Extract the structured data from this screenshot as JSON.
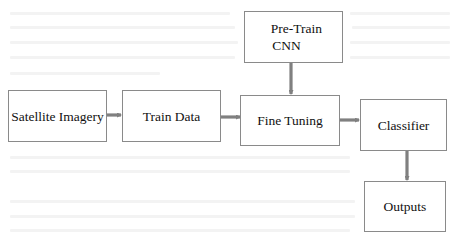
{
  "diagram": {
    "type": "flowchart",
    "nodes": [
      {
        "id": "satellite",
        "label": "Satellite Imagery"
      },
      {
        "id": "train_data",
        "label": "Train Data"
      },
      {
        "id": "fine_tuning",
        "label": "Fine Tuning"
      },
      {
        "id": "pretrain",
        "label_line1": "Pre-Train",
        "label_line2": "CNN"
      },
      {
        "id": "classifier",
        "label": "Classifier"
      },
      {
        "id": "outputs",
        "label": "Outputs"
      }
    ],
    "edges": [
      {
        "from": "satellite",
        "to": "train_data"
      },
      {
        "from": "train_data",
        "to": "fine_tuning"
      },
      {
        "from": "pretrain",
        "to": "fine_tuning"
      },
      {
        "from": "fine_tuning",
        "to": "classifier"
      },
      {
        "from": "classifier",
        "to": "outputs"
      }
    ],
    "colors": {
      "box_border": "#8a8a8a",
      "arrow": "#808080",
      "text": "#111111",
      "background": "#ffffff"
    }
  }
}
